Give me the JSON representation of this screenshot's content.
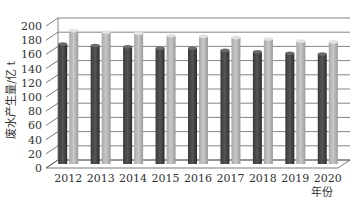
{
  "chart_data": {
    "type": "bar",
    "style": "3d-clustered-column",
    "title": "",
    "xlabel": "年份",
    "ylabel": "废水产生量/亿 t",
    "ylim": [
      0,
      200
    ],
    "yticks": [
      0,
      20,
      40,
      60,
      80,
      100,
      120,
      140,
      160,
      180,
      200
    ],
    "grid": true,
    "legend": "none",
    "categories": [
      "2012",
      "2013",
      "2014",
      "2015",
      "2016",
      "2017",
      "2018",
      "2019",
      "2020"
    ],
    "series": [
      {
        "name": "series-dark",
        "color": "#555555",
        "values": [
          169,
          167,
          165,
          163,
          163,
          160,
          158,
          156,
          155
        ]
      },
      {
        "name": "series-light",
        "color": "#c8c8c8",
        "values": [
          188,
          186,
          184,
          181,
          180,
          178,
          176,
          173,
          172
        ]
      }
    ]
  }
}
